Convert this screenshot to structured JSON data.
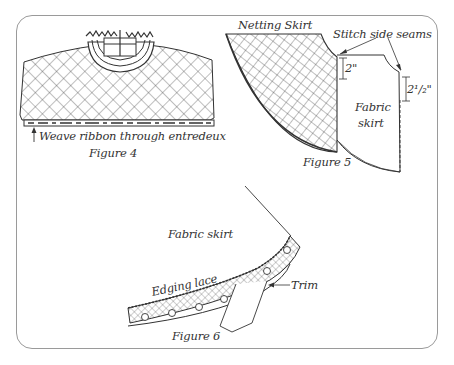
{
  "figures": [
    {
      "id": "figure-4",
      "caption": "Figure 4",
      "annotations": [
        {
          "text": "Weave ribbon through entredeux"
        }
      ]
    },
    {
      "id": "figure-5",
      "caption": "Figure 5",
      "annotations": [
        {
          "text": "Netting Skirt"
        },
        {
          "text": "Stitch side seams"
        },
        {
          "text": "2\""
        },
        {
          "text": "2¹/₂\""
        },
        {
          "text": "Fabric"
        },
        {
          "text": "skirt"
        }
      ]
    },
    {
      "id": "figure-6",
      "caption": "Figure 6",
      "annotations": [
        {
          "text": "Fabric skirt"
        },
        {
          "text": "Edging lace"
        },
        {
          "text": "Trim"
        }
      ]
    }
  ],
  "colors": {
    "line": "#333333",
    "frame": "#9a9a9a",
    "background": "#ffffff"
  }
}
